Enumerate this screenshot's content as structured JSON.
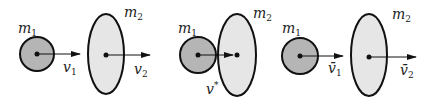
{
  "colors": {
    "small_body_fill": "#b5b5b5",
    "large_body_fill": "#e6e6e6",
    "stroke": "#111111"
  },
  "panels": [
    {
      "name": "before-collision",
      "m1_label": "m",
      "m1_sub": "1",
      "m2_label": "m",
      "m2_sub": "2",
      "v1_label": "v",
      "v1_sub": "1",
      "v2_label": "v",
      "v2_sub": "2"
    },
    {
      "name": "during-collision",
      "m1_label": "m",
      "m1_sub": "1",
      "m2_label": "m",
      "m2_sub": "2",
      "v_label": "v",
      "v_sup": "*"
    },
    {
      "name": "after-collision",
      "m1_label": "m",
      "m1_sub": "1",
      "m2_label": "m",
      "m2_sub": "2",
      "v1_label": "v̄",
      "v1_sub": "1",
      "v2_label": "v̄",
      "v2_sub": "2"
    }
  ]
}
